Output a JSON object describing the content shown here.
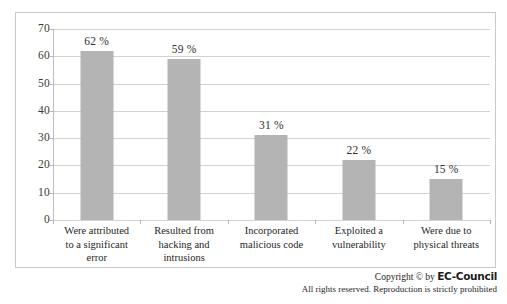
{
  "chart_data": {
    "type": "bar",
    "title": "",
    "xlabel": "",
    "ylabel": "",
    "ylim": [
      0,
      70
    ],
    "grid": true,
    "legend": "none",
    "yticks": [
      0,
      10,
      20,
      30,
      40,
      50,
      60,
      70
    ],
    "ytick_labels": [
      "0",
      "10",
      "20",
      "30",
      "40",
      "50",
      "60",
      "70"
    ],
    "categories": [
      "Were attributed to a significant error",
      "Resulted from hacking and intrusions",
      "Incorporated malicious code",
      "Exploited a vulnerability",
      "Were due to physical threats"
    ],
    "category_lines": [
      [
        "Were attributed",
        "to a significant",
        "error"
      ],
      [
        "Resulted from",
        "hacking and",
        "intrusions"
      ],
      [
        "Incorporated",
        "malicious code"
      ],
      [
        "Exploited a",
        "vulnerability"
      ],
      [
        "Were due to",
        "physical threats"
      ]
    ],
    "values": [
      62,
      59,
      31,
      22,
      15
    ],
    "data_labels": [
      "62 %",
      "59 %",
      "31 %",
      "22 %",
      "15 %"
    ],
    "bar_color": "#b4b4b4",
    "gridline_color": "#d2d2d2",
    "axis_color": "#b5b5b5",
    "frame_color": "#c9c9c9",
    "background": "#ffffff"
  },
  "footer": {
    "copyright_prefix": "Copyright © by ",
    "brand": "EC-Council",
    "rights": "All rights reserved. Reproduction is strictly prohibited"
  }
}
